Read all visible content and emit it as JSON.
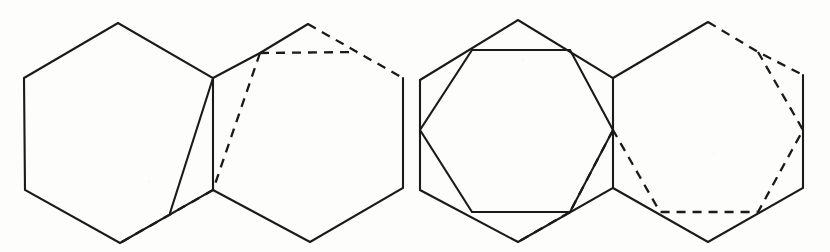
{
  "figure": {
    "width": 830,
    "height": 252,
    "background_color": "#fdfdfc",
    "ink_color": "#1a1a1a",
    "caption": "",
    "panels": [
      {
        "name": "left-panel",
        "label": "",
        "shapes": [
          {
            "name": "left-hexagon-solid",
            "style": "solid",
            "closed": true,
            "points": "24,78 118,23 213,78 213,190 120,243 25,190"
          },
          {
            "name": "right-hexagon-partial-solid",
            "style": "solid",
            "closed": false,
            "points": "213,78 260,53 308,24"
          },
          {
            "name": "right-hexagon-right-solid",
            "style": "solid",
            "closed": false,
            "points": "403,78 403,188 310,242 213,190"
          },
          {
            "name": "right-hexagon-top-dashed",
            "style": "dashed",
            "closed": false,
            "points": "308,24 357,52 403,78"
          },
          {
            "name": "inner-hexagon-top-dashed",
            "style": "dashed",
            "closed": false,
            "points": "260,53 357,52"
          },
          {
            "name": "inner-hexagon-diagonal-dashed",
            "style": "dashed",
            "closed": false,
            "points": "260,53 213,190"
          },
          {
            "name": "inner-hexagon-bottom-dashed",
            "style": "dashed",
            "closed": false,
            "points": "213,190 120,243"
          },
          {
            "name": "inner-hexagon-diagonal-solid",
            "style": "solid",
            "closed": false,
            "points": "213,78 170,213"
          }
        ]
      },
      {
        "name": "right-panel",
        "label": "",
        "shapes": [
          {
            "name": "left-hexagon-solid-2",
            "style": "solid",
            "closed": true,
            "points": "420,80 518,20 613,78 613,188 518,242 420,190"
          },
          {
            "name": "inscribed-octagon-solid",
            "style": "solid",
            "closed": true,
            "points": "472,50 570,50 613,130 570,212 472,212 420,130"
          },
          {
            "name": "right-hexagon-left-solid",
            "style": "solid",
            "closed": false,
            "points": "613,78 708,22"
          },
          {
            "name": "right-hexagon-right-solid-2",
            "style": "solid",
            "closed": false,
            "points": "803,75 803,188 708,242 613,188"
          },
          {
            "name": "right-hexagon-top-dashed-2",
            "style": "dashed",
            "closed": false,
            "points": "708,22 758,52 803,75"
          },
          {
            "name": "right-octagon-dashed",
            "style": "dashed",
            "closed": false,
            "points": "758,52 803,130 758,212 660,212 613,130"
          },
          {
            "name": "right-octagon-left-dashed",
            "style": "dashed",
            "closed": false,
            "points": "613,130 570,212"
          },
          {
            "name": "mid-bottom-dashed",
            "style": "dashed",
            "closed": false,
            "points": "570,212 518,242"
          }
        ]
      }
    ]
  }
}
